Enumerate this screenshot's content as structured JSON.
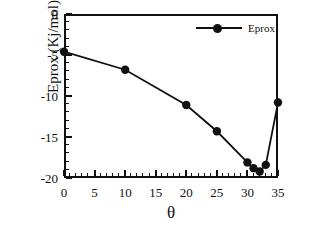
{
  "chart_data": {
    "type": "line",
    "title": "",
    "xlabel": "θ",
    "ylabel": "Eprox (Kj/mol)",
    "xlim": [
      0,
      35
    ],
    "ylim": [
      -20,
      0
    ],
    "xticks": [
      0,
      5,
      10,
      15,
      20,
      25,
      30,
      35
    ],
    "xtick_labels": [
      "0",
      "5",
      "10",
      "15",
      "20",
      "25",
      "30",
      "35"
    ],
    "yticks": [
      0,
      -5,
      -10,
      -15,
      -20
    ],
    "ytick_labels": [
      "0",
      "-5",
      "-10",
      "-15",
      "-20"
    ],
    "x_minor_tick_interval": 1,
    "y_minor_tick_interval": 1,
    "grid": false,
    "legend_position": "top-right",
    "marker": "filled-circle",
    "line_color": "#111111",
    "marker_color": "#111111",
    "series": [
      {
        "name": "Eprox",
        "x": [
          0,
          10,
          20,
          25,
          30,
          31,
          32,
          33,
          35
        ],
        "values": [
          -4.6,
          -6.8,
          -11.1,
          -14.3,
          -18.1,
          -18.8,
          -19.2,
          -18.4,
          -10.8
        ]
      }
    ]
  },
  "legend": {
    "entries": [
      {
        "label": "Eprox",
        "marker": "filled-circle-with-line"
      }
    ]
  },
  "axes": {
    "x_axis_label": "θ",
    "y_axis_label": "Eprox (Kj/mol)"
  }
}
